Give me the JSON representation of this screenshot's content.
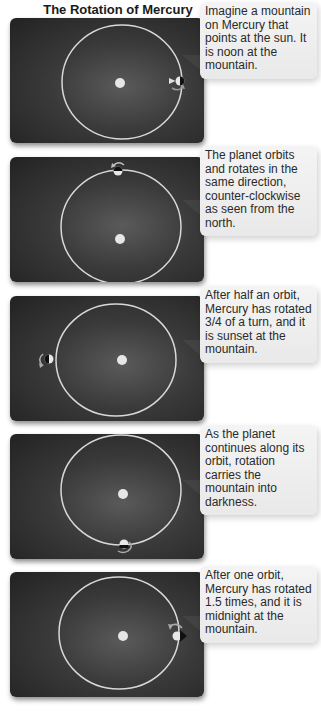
{
  "title": "The Rotation of Mercury",
  "colors": {
    "panel_bg": "#333333",
    "orbit": "#d8d8d8",
    "sun": "#e6e6e6",
    "callout_bg": "#efefef",
    "text": "#2a2a2a"
  },
  "panels": [
    {
      "caption": "Imagine a mountain on Mercury that points at the sun. It is noon at the mountain.",
      "planet_position": "right (3 o'clock)",
      "mountain_state": "noon"
    },
    {
      "caption": "The planet orbits and rotates in the same direction, counter-clockwise as seen from the north.",
      "planet_position": "top (12 o'clock)",
      "mountain_state": "rotating"
    },
    {
      "caption": "After half an orbit, Mercury has rotated 3/4 of a turn, and it is sunset at the mountain.",
      "planet_position": "left (9 o'clock)",
      "mountain_state": "sunset"
    },
    {
      "caption": "As the planet continues along its orbit, rotation carries the mountain into darkness.",
      "planet_position": "bottom (6 o'clock)",
      "mountain_state": "darkness"
    },
    {
      "caption": "After one orbit, Mercury has rotated 1.5 times, and it is midnight at the mountain.",
      "planet_position": "right (3 o'clock)",
      "mountain_state": "midnight"
    }
  ]
}
